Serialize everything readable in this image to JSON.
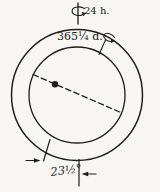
{
  "figure": {
    "background_color": "#f7f6f2",
    "ink_color": "#1f1e1c",
    "labels": {
      "rotation_period": "24 h.",
      "revolution_period": "365¼ d.",
      "axial_tilt": "23½°"
    },
    "icons": {
      "rotation_curl": "curled-rotation-arrow",
      "revolution_curl": "curled-rotation-arrow",
      "tilt_left_arrow": "right-pointing-dimension-arrow",
      "tilt_right_arrow": "left-pointing-dimension-arrow"
    }
  }
}
